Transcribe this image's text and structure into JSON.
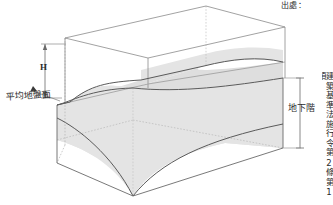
{
  "figure": {
    "source_prefix": "出處：",
    "vertical_source_text": "建築基準法施行令第2條第1項",
    "labels": {
      "height_dimension": "H",
      "average_ground_level": "平均地盤面",
      "basement_level": "地下階"
    },
    "colors": {
      "shaded_volume_fill": "#e4e4e4",
      "shaded_volume_fill_dark": "#dcdcdc",
      "solid_edge": "#555555",
      "hidden_edge": "#aaaaaa",
      "dimension_line": "#6b6b6b",
      "text": "#2b2b2b",
      "background": "#ffffff"
    },
    "geometry": {
      "box_top_back_left": [
        65,
        38
      ],
      "box_top_back_right": [
        206,
        6
      ],
      "box_top_front_right": [
        285,
        27
      ],
      "box_top_front_left": [
        148,
        58
      ],
      "box_bottom_front_left": [
        57,
        163
      ],
      "box_bottom_front_right": [
        282,
        148
      ],
      "ground_level_y": 96,
      "basement_dim_top_y": 78,
      "basement_dim_bottom_y": 148,
      "h_dim_top_y": 44,
      "h_dim_bottom_y": 98
    }
  }
}
